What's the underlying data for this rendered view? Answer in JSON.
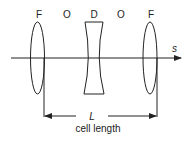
{
  "diagram": {
    "element_labels": [
      "F",
      "O",
      "D",
      "O",
      "F"
    ],
    "axis_label": "s",
    "length_symbol": "L",
    "length_caption": "cell length",
    "elements": [
      {
        "type": "focusing-lens",
        "label": "F"
      },
      {
        "type": "drift",
        "label": "O"
      },
      {
        "type": "defocusing-lens",
        "label": "D"
      },
      {
        "type": "drift",
        "label": "O"
      },
      {
        "type": "focusing-lens",
        "label": "F"
      }
    ]
  }
}
